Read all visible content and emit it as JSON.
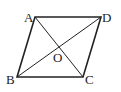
{
  "diagram": {
    "type": "parallelogram",
    "vertices": {
      "A": {
        "label": "A",
        "x": 35,
        "y": 17
      },
      "D": {
        "label": "D",
        "x": 101,
        "y": 17
      },
      "C": {
        "label": "C",
        "x": 83,
        "y": 77
      },
      "B": {
        "label": "B",
        "x": 17,
        "y": 77
      }
    },
    "intersection": {
      "label": "O",
      "x": 59,
      "y": 47
    },
    "edges": [
      "AD",
      "DC",
      "CB",
      "BA"
    ],
    "diagonals": [
      "AC",
      "BD"
    ],
    "colors": {
      "stroke": "#222222",
      "background": "#ffffff"
    }
  }
}
